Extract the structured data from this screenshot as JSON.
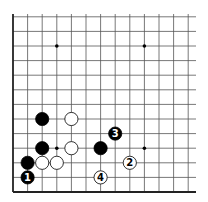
{
  "board": {
    "origin_x": 13,
    "origin_y": 192,
    "spacing": 14.6,
    "cols": 13,
    "rows": 12,
    "line_color": "#555555",
    "edge_color": "#222222",
    "hoshi": [
      [
        3,
        3
      ],
      [
        3,
        10
      ],
      [
        9,
        10
      ],
      [
        9,
        3
      ]
    ]
  },
  "stones": [
    {
      "color": "black",
      "col": 1,
      "row": 1,
      "label": "1"
    },
    {
      "color": "black",
      "col": 1,
      "row": 2,
      "label": ""
    },
    {
      "color": "white",
      "col": 2,
      "row": 2,
      "label": ""
    },
    {
      "color": "white",
      "col": 3,
      "row": 2,
      "label": ""
    },
    {
      "color": "black",
      "col": 2,
      "row": 3,
      "label": ""
    },
    {
      "color": "white",
      "col": 4,
      "row": 3,
      "label": ""
    },
    {
      "color": "black",
      "col": 2,
      "row": 5,
      "label": ""
    },
    {
      "color": "white",
      "col": 4,
      "row": 5,
      "label": ""
    },
    {
      "color": "black",
      "col": 6,
      "row": 3,
      "label": ""
    },
    {
      "color": "black",
      "col": 7,
      "row": 4,
      "label": "3"
    },
    {
      "color": "white",
      "col": 8,
      "row": 2,
      "label": "2"
    },
    {
      "color": "white",
      "col": 6,
      "row": 1,
      "label": "4"
    }
  ]
}
